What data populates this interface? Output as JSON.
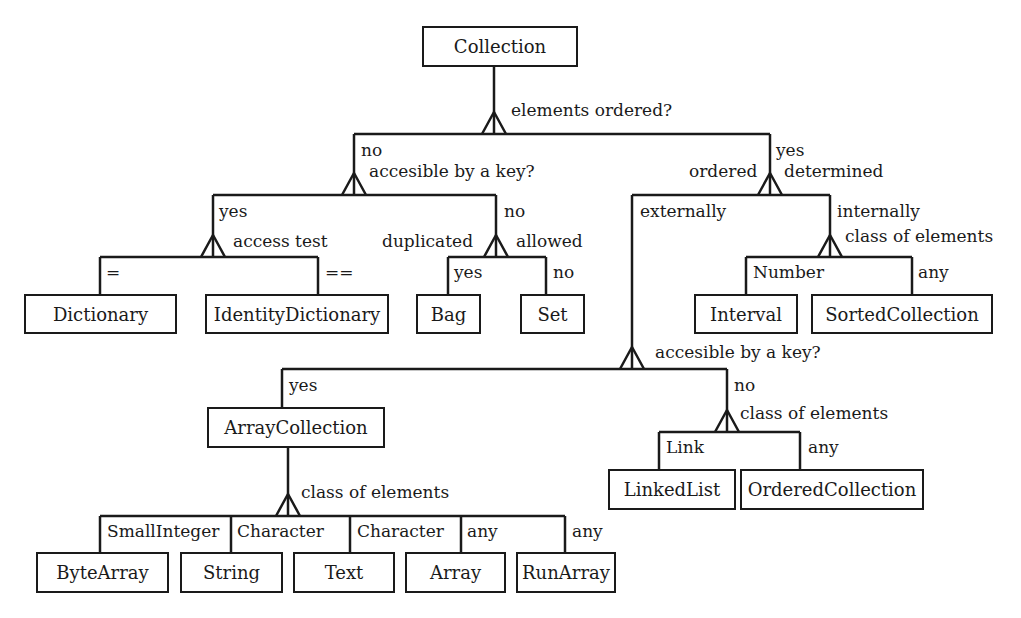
{
  "nodes": {
    "collection": "Collection",
    "dictionary": "Dictionary",
    "identity_dictionary": "IdentityDictionary",
    "bag": "Bag",
    "set": "Set",
    "interval": "Interval",
    "sorted_collection": "SortedCollection",
    "array_collection": "ArrayCollection",
    "linked_list": "LinkedList",
    "ordered_collection": "OrderedCollection",
    "byte_array": "ByteArray",
    "string": "String",
    "text": "Text",
    "array": "Array",
    "run_array": "RunArray"
  },
  "questions": {
    "elements_ordered": "elements ordered?",
    "accessible_key_1": "accesible by a key?",
    "access_test": "access test",
    "duplicated": "duplicated",
    "allowed": "allowed",
    "ordered": "ordered",
    "determined": "determined",
    "class_of_elements_1": "class of elements",
    "accessible_key_2": "accesible by a key?",
    "class_of_elements_2": "class of elements",
    "class_of_elements_3": "class of elements"
  },
  "edges": {
    "no_1": "no",
    "yes_1": "yes",
    "yes_2": "yes",
    "no_2": "no",
    "eq": "=",
    "eqeq": "==",
    "yes_3": "yes",
    "no_3": "no",
    "externally": "externally",
    "internally": "internally",
    "number": "Number",
    "any_1": "any",
    "yes_4": "yes",
    "no_4": "no",
    "link": "Link",
    "any_2": "any",
    "small_integer": "SmallInteger",
    "character_1": "Character",
    "character_2": "Character",
    "any_3": "any",
    "any_4": "any"
  },
  "colors": {
    "ink": "#1a1a1a",
    "background": "#ffffff"
  }
}
